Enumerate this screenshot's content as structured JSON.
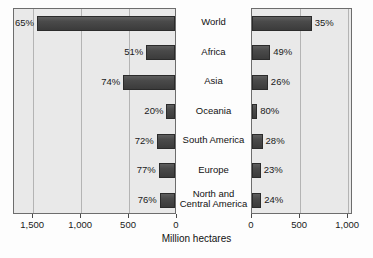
{
  "chart_data": {
    "type": "bar",
    "title": "",
    "subtitle": "",
    "orientation": "horizontal",
    "layout": "back-to-back mirrored bar chart",
    "xlabel": "Million hectares",
    "ylabel": "",
    "grid": true,
    "legend": "none",
    "categories": [
      "World",
      "Africa",
      "Asia",
      "Oceania",
      "South America",
      "Europe",
      "North and Central America"
    ],
    "panels": [
      {
        "name": "left",
        "axis_direction": "reversed",
        "xlim": [
          0,
          1700
        ],
        "ticks": [
          1500,
          1000,
          500,
          0
        ],
        "tick_labels": [
          "1,500",
          "1,000",
          "500",
          "0"
        ],
        "values": [
          1440,
          300,
          540,
          90,
          190,
          170,
          160
        ],
        "data_labels": [
          "65%",
          "51%",
          "74%",
          "20%",
          "72%",
          "77%",
          "76%"
        ]
      },
      {
        "name": "right",
        "axis_direction": "normal",
        "xlim": [
          0,
          1050
        ],
        "ticks": [
          0,
          500,
          1000
        ],
        "tick_labels": [
          "0",
          "500",
          "1,000"
        ],
        "values": [
          620,
          190,
          165,
          55,
          110,
          90,
          95
        ],
        "data_labels": [
          "35%",
          "49%",
          "26%",
          "80%",
          "28%",
          "23%",
          "24%"
        ]
      }
    ]
  },
  "colors": {
    "bar_fill": "#4a4a4a",
    "bar_edge": "#2b2b2b",
    "panel_bg": "#e9e9e9",
    "panel_border": "#6d6d6d",
    "gridline": "#b4b4b4",
    "text": "#1a1a1a"
  }
}
